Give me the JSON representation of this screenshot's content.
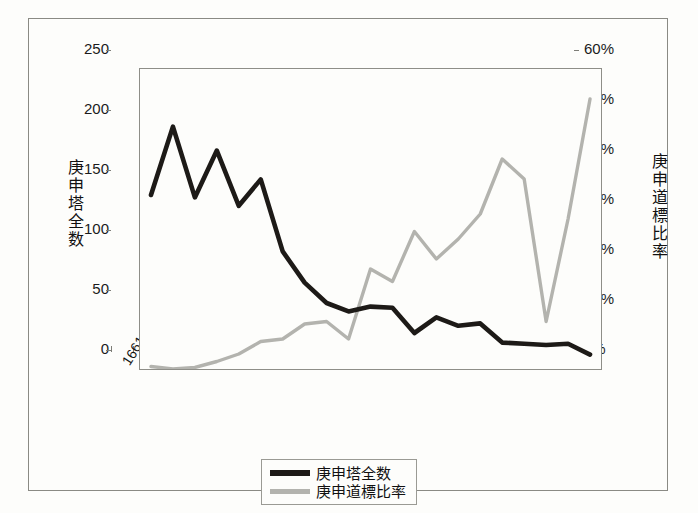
{
  "chart_data": {
    "type": "line",
    "title": "",
    "xlabel": "",
    "ylabel": "庚申塔全数",
    "y2label": "庚申道標比率",
    "grid": false,
    "legend_position": "bottom-center",
    "ylim": [
      0,
      250
    ],
    "y2lim": [
      0,
      60
    ],
    "yticks": [
      "0",
      "50",
      "100",
      "150",
      "200",
      "250"
    ],
    "y2ticks": [
      "0%",
      "10%",
      "20%",
      "30%",
      "40%",
      "50%",
      "60%"
    ],
    "categories": [
      "1661～",
      "1671～",
      "1681～",
      "1691～",
      "1701～",
      "1711～",
      "1721～",
      "1731～",
      "1741～",
      "1751～",
      "1761～",
      "1771～",
      "1781～",
      "1791～",
      "1801～",
      "1811～",
      "1821～",
      "1831～",
      "1841～",
      "1851～",
      "1861～"
    ],
    "series": [
      {
        "name": "庚申塔全数",
        "axis": "left",
        "color": "#1d1a17",
        "values": [
          145,
          202,
          143,
          182,
          136,
          158,
          98,
          72,
          55,
          48,
          52,
          51,
          30,
          43,
          36,
          38,
          22,
          21,
          20,
          21,
          12
        ]
      },
      {
        "name": "庚申道標比率",
        "axis": "right",
        "color": "#b3b3ae",
        "values": [
          0.5,
          0.0,
          0.3,
          1.5,
          3.0,
          5.5,
          6.0,
          9.0,
          9.5,
          6.0,
          20.0,
          17.5,
          27.5,
          22.0,
          26.0,
          31.0,
          42.0,
          38.0,
          9.5,
          30.0,
          54.0
        ]
      }
    ]
  },
  "axis_titles": {
    "left_chars": [
      "庚",
      "申",
      "塔",
      "全",
      "数"
    ],
    "right_chars": [
      "庚",
      "申",
      "道",
      "標",
      "比",
      "率"
    ]
  },
  "legend": {
    "items": [
      {
        "label": "庚申塔全数",
        "color": "#1d1a17",
        "style": "black-line"
      },
      {
        "label": "庚申道標比率",
        "color": "#b3b3ae",
        "style": "gray-line"
      }
    ]
  }
}
